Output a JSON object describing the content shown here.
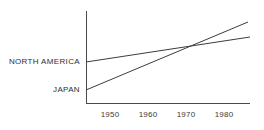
{
  "chart_data": {
    "type": "line",
    "title": "",
    "subtitle": "",
    "xlabel": "",
    "ylabel": "",
    "xlim": [
      1946,
      1989
    ],
    "ylim": [
      0,
      100
    ],
    "grid": false,
    "legend_position": "inline-left",
    "x_ticks": [
      "1950",
      "1960",
      "1970",
      "1980"
    ],
    "x_tick_values": [
      1950,
      1960,
      1970,
      1980
    ],
    "y_ticks": [],
    "series": [
      {
        "name": "NORTH AMERICA",
        "label": "NORTH AMERICA",
        "x": [
          1946,
          1989
        ],
        "values": [
          45,
          72
        ],
        "annotation": "shallow steady rise"
      },
      {
        "name": "JAPAN",
        "label": "JAPAN",
        "x": [
          1946,
          1988
        ],
        "values": [
          14,
          88
        ],
        "annotation": "steep rise, crosses North America near 1972"
      }
    ],
    "intersection": {
      "x": 1972,
      "y": 66,
      "note": "Japan overtakes North America"
    },
    "colors": {
      "axis": "#4a4a4a",
      "line": "#3c3c3c",
      "text": "#2e2e2e",
      "background": "#ffffff"
    }
  },
  "geometry": {
    "axis": {
      "x_origin": 86,
      "y_origin": 103,
      "y_top": 11,
      "x_right": 250
    },
    "tick_positions": [
      110,
      148,
      186,
      224
    ],
    "tick_label_y": 117,
    "series_pixels": [
      {
        "x1": 86,
        "y1": 62,
        "x2": 250,
        "y2": 37,
        "label_x": 80,
        "label_y": 64
      },
      {
        "x1": 86,
        "y1": 90,
        "x2": 248,
        "y2": 22,
        "label_x": 80,
        "label_y": 92
      }
    ]
  }
}
